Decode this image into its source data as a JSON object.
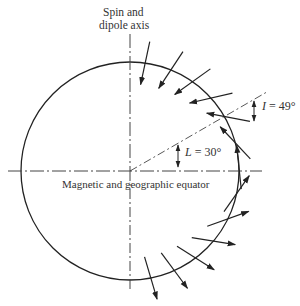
{
  "labels": {
    "axis_line1": "Spin and",
    "axis_line2": "dipole axis",
    "equator": "Magnetic and geographic equator",
    "L_symbol": "L",
    "L_value": " = 30°",
    "I_symbol": "I",
    "I_value": " = 49°"
  },
  "geometry": {
    "center": [
      130,
      171
    ],
    "radius": 109,
    "radial_line_angle_deg": 30,
    "radial_line_length": 160,
    "arrow_length": 44
  },
  "field_arrows": {
    "description": "Dipole field vectors along the right half of the Earth; inclination tan I = 2 tan L",
    "latitudes_deg": [
      82,
      68,
      55,
      42,
      30,
      15,
      2,
      -12,
      -26,
      -40,
      -53,
      -66,
      -79
    ],
    "highlighted_latitude_deg": 30,
    "highlighted_inclination_deg": 49
  },
  "colors": {
    "stroke": "#222222",
    "background": "#ffffff"
  }
}
